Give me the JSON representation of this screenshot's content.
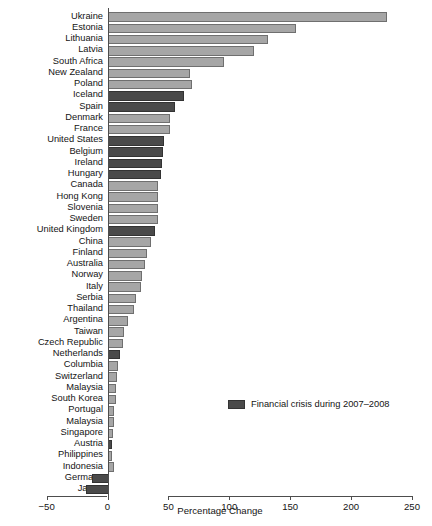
{
  "chart_data": {
    "type": "bar",
    "orientation": "horizontal",
    "title": "",
    "xlabel": "Percentage Change",
    "ylabel": "",
    "xlim": [
      -50,
      250
    ],
    "xticks": [
      -50,
      0,
      50,
      100,
      150,
      200,
      250
    ],
    "xtick_labels": [
      "−50",
      "0",
      "50",
      "100",
      "150",
      "200",
      "250"
    ],
    "grid": false,
    "legend": {
      "position": "center-right",
      "entries": [
        {
          "label": "Financial crisis during 2007–2008",
          "color": "#4a4a4a"
        }
      ]
    },
    "series_colors": {
      "normal": "#a6a6a6",
      "crisis": "#4a4a4a"
    },
    "categories": [
      "Ukraine",
      "Estonia",
      "Lithuania",
      "Latvia",
      "South Africa",
      "New Zealand",
      "Poland",
      "Iceland",
      "Spain",
      "Denmark",
      "France",
      "United States",
      "Belgium",
      "Ireland",
      "Hungary",
      "Canada",
      "Hong Kong",
      "Slovenia",
      "Sweden",
      "United Kingdom",
      "China",
      "Finland",
      "Australia",
      "Norway",
      "Italy",
      "Serbia",
      "Thailand",
      "Argentina",
      "Taiwan",
      "Czech Republic",
      "Netherlands",
      "Columbia",
      "Switzerland",
      "Malaysia",
      "South Korea",
      "Portugal",
      "Malaysia",
      "Singapore",
      "Austria",
      "Philippines",
      "Indonesia",
      "Germany",
      "Japan"
    ],
    "values": [
      228,
      153,
      130,
      119,
      94,
      66,
      68,
      61,
      54,
      50,
      50,
      45,
      44,
      43,
      42,
      40,
      40,
      40,
      40,
      37,
      34,
      31,
      29,
      27,
      26,
      22,
      20,
      15,
      12,
      11,
      9,
      7,
      6,
      5,
      5,
      4,
      4,
      3,
      2,
      2,
      4,
      -13,
      -18
    ],
    "crisis_flags": [
      false,
      false,
      false,
      false,
      false,
      false,
      false,
      true,
      true,
      false,
      false,
      true,
      true,
      true,
      true,
      false,
      false,
      false,
      false,
      true,
      false,
      false,
      false,
      false,
      false,
      false,
      false,
      false,
      false,
      false,
      true,
      false,
      false,
      false,
      false,
      false,
      false,
      false,
      true,
      false,
      false,
      true,
      true
    ]
  }
}
